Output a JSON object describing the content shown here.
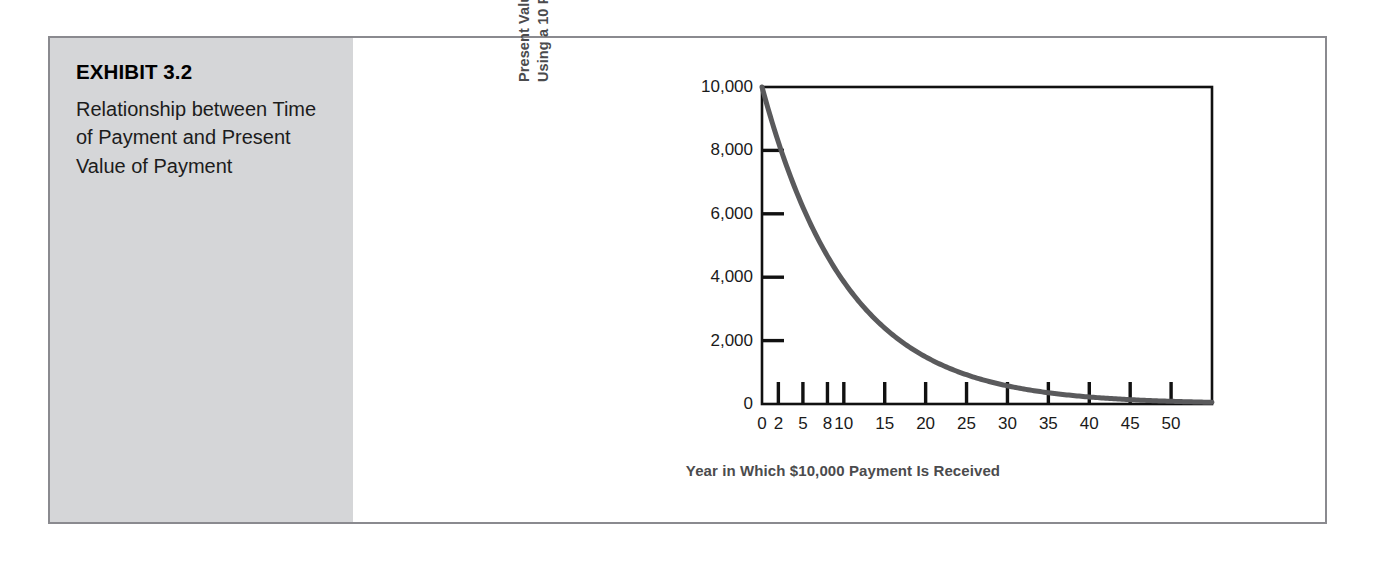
{
  "exhibit": {
    "number": "EXHIBIT 3.2",
    "caption": "Relationship between Time of Payment and Present Value of Payment"
  },
  "colors": {
    "panel_background": "#d5d6d8",
    "frame_border": "#8a8a8f",
    "axis": "#111111",
    "curve": "#5a5a5c",
    "axis_title": "#4b4b4d",
    "tick_label": "#1a1a1a",
    "page_background": "#ffffff"
  },
  "chart_data": {
    "type": "line",
    "title": "",
    "subtitle": "",
    "xlabel": "Year in Which $10,000 Payment Is Received",
    "ylabel": "Present Value of $10,000 Payment\nUsing a 10 Percent Discount Rate",
    "ylabel_lines": [
      "Present Value of $10,000 Payment",
      "Using a 10 Percent Discount Rate"
    ],
    "xlim": [
      0,
      55
    ],
    "ylim": [
      0,
      10000
    ],
    "grid": false,
    "legend": null,
    "discount_rate_percent": 10,
    "payment_amount": 10000,
    "xticks": [
      0,
      2,
      5,
      8,
      10,
      15,
      20,
      25,
      30,
      35,
      40,
      45,
      50
    ],
    "xticklabels": [
      "0",
      "2",
      "5",
      "8",
      "10",
      "15",
      "20",
      "25",
      "30",
      "35",
      "40",
      "45",
      "50"
    ],
    "yticks": [
      0,
      2000,
      4000,
      6000,
      8000,
      10000
    ],
    "yticklabels": [
      "0",
      "2,000",
      "4,000",
      "6,000",
      "8,000",
      "10,000"
    ],
    "series": [
      {
        "name": "Present value of $10,000 at 10% discount rate",
        "x": [
          0,
          2,
          5,
          8,
          10,
          15,
          20,
          25,
          30,
          35,
          40,
          45,
          50
        ],
        "values": [
          10000,
          8264,
          6209,
          4665,
          3855,
          2394,
          1486,
          923,
          573,
          356,
          221,
          137,
          85
        ]
      }
    ]
  }
}
